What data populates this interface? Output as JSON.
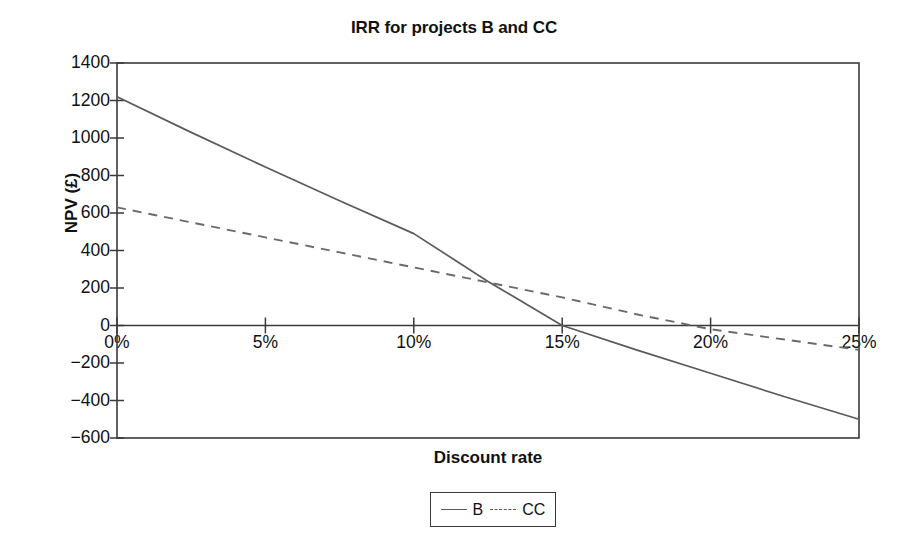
{
  "chart_data": {
    "type": "line",
    "title": "IRR for projects B and CC",
    "xlabel": "Discount rate",
    "ylabel": "NPV (£)",
    "xlim": [
      0,
      25
    ],
    "ylim": [
      -600,
      1400
    ],
    "xtick_labels": [
      "0%",
      "5%",
      "10%",
      "15%",
      "20%",
      "25%"
    ],
    "xtick_values": [
      0,
      5,
      10,
      15,
      20,
      25
    ],
    "ytick_labels": [
      "1400",
      "1200",
      "1000",
      "800",
      "600",
      "400",
      "200",
      "0",
      "−200",
      "−400",
      "−600"
    ],
    "ytick_values": [
      1400,
      1200,
      1000,
      800,
      600,
      400,
      200,
      0,
      -200,
      -400,
      -600
    ],
    "grid": false,
    "legend_position": "bottom-center",
    "zero_line": 0,
    "series": [
      {
        "name": "B",
        "style": "solid",
        "color": "#5a5a5a",
        "x": [
          0,
          2.5,
          5,
          7.5,
          10,
          12.5,
          15,
          17.5,
          20,
          22.5,
          25
        ],
        "values": [
          1220,
          1030,
          845,
          665,
          490,
          235,
          0,
          -130,
          -255,
          -380,
          -500
        ]
      },
      {
        "name": "CC",
        "style": "dashed",
        "color": "#6a6a6a",
        "x": [
          0,
          2.5,
          5,
          7.5,
          10,
          12.5,
          15,
          17.5,
          20,
          22.5,
          25
        ],
        "values": [
          630,
          550,
          470,
          390,
          310,
          230,
          150,
          60,
          -20,
          -75,
          -130
        ]
      }
    ],
    "annotations": {
      "crossover_point": "B and CC intersect near 11.3% at NPV ≈ 245",
      "irr_b": "B crosses zero NPV at 15%",
      "irr_cc": "CC crosses zero NPV at approximately 19.5%"
    }
  },
  "legend": {
    "items": [
      {
        "label": "B",
        "style": "solid"
      },
      {
        "label": "CC",
        "style": "dashed"
      }
    ]
  },
  "colors": {
    "axis": "#3a3a3a",
    "series_b": "#5a5a5a",
    "series_cc": "#6a6a6a",
    "text": "#111111",
    "background": "#ffffff"
  }
}
